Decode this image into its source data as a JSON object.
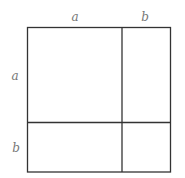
{
  "diagram": {
    "top_labels": [
      "a",
      "b"
    ],
    "left_labels": [
      "a",
      "b"
    ],
    "square": {
      "x": 27,
      "y": 27,
      "size": 144
    },
    "split": {
      "x": 122,
      "y": 122
    },
    "regions": [
      {
        "name": "a-squared",
        "row": "a",
        "col": "a"
      },
      {
        "name": "ab-top-right",
        "row": "a",
        "col": "b"
      },
      {
        "name": "ab-bottom-left",
        "row": "b",
        "col": "a"
      },
      {
        "name": "b-squared",
        "row": "b",
        "col": "b"
      }
    ],
    "colors": {
      "line": "#333333",
      "label": "#777777",
      "background": "#ffffff"
    }
  }
}
